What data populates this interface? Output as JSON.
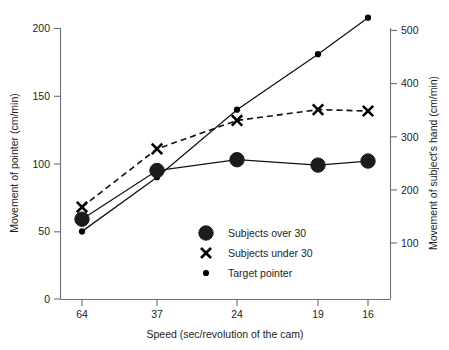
{
  "chart_data": {
    "type": "line",
    "title": "",
    "subtitle": "",
    "xlabel": "Speed (sec/revolution of the cam)",
    "ylabel": "Movement of pointer (cm/min)",
    "y2label": "Movement of subject's hand (cm/min)",
    "categories": [
      "64",
      "37",
      "24",
      "19",
      "16"
    ],
    "ylim": [
      0,
      200
    ],
    "yticks": [
      "0",
      "50",
      "100",
      "150",
      "200"
    ],
    "y2lim": [
      0,
      510
    ],
    "y2ticks": [
      "100",
      "200",
      "300",
      "400",
      "500"
    ],
    "grid": false,
    "legend_position": "inside-lower-center",
    "series": [
      {
        "name": "Subjects over 30",
        "marker": "large-filled-circle",
        "linestyle": "solid",
        "values": [
          59,
          95,
          103,
          99,
          102
        ]
      },
      {
        "name": "Subjects under 30",
        "marker": "x-cross",
        "linestyle": "dashed",
        "values": [
          68,
          111,
          132,
          140,
          139
        ]
      },
      {
        "name": "Target pointer",
        "marker": "small-dot",
        "linestyle": "solid",
        "values": [
          50,
          90,
          140,
          181,
          208
        ]
      }
    ]
  },
  "axes": {
    "left": {
      "title": "Movement of pointer (cm/min)",
      "ticks": [
        "0",
        "50",
        "100",
        "150",
        "200"
      ]
    },
    "right": {
      "title": "Movement of subject's hand (cm/min)",
      "ticks": [
        "100",
        "200",
        "300",
        "400",
        "500"
      ]
    },
    "bottom": {
      "title": "Speed (sec/revolution of the cam)",
      "ticks": [
        "64",
        "37",
        "24",
        "19",
        "16"
      ]
    }
  },
  "legend": {
    "items": [
      {
        "label": "Subjects over 30",
        "marker": "large-filled-circle"
      },
      {
        "label": "Subjects under 30",
        "marker": "x-cross"
      },
      {
        "label": "Target pointer",
        "marker": "small-dot"
      }
    ]
  },
  "colors": {
    "ink": "#1a1a1a",
    "axis": "#6e6e6e",
    "background": "#ffffff"
  }
}
